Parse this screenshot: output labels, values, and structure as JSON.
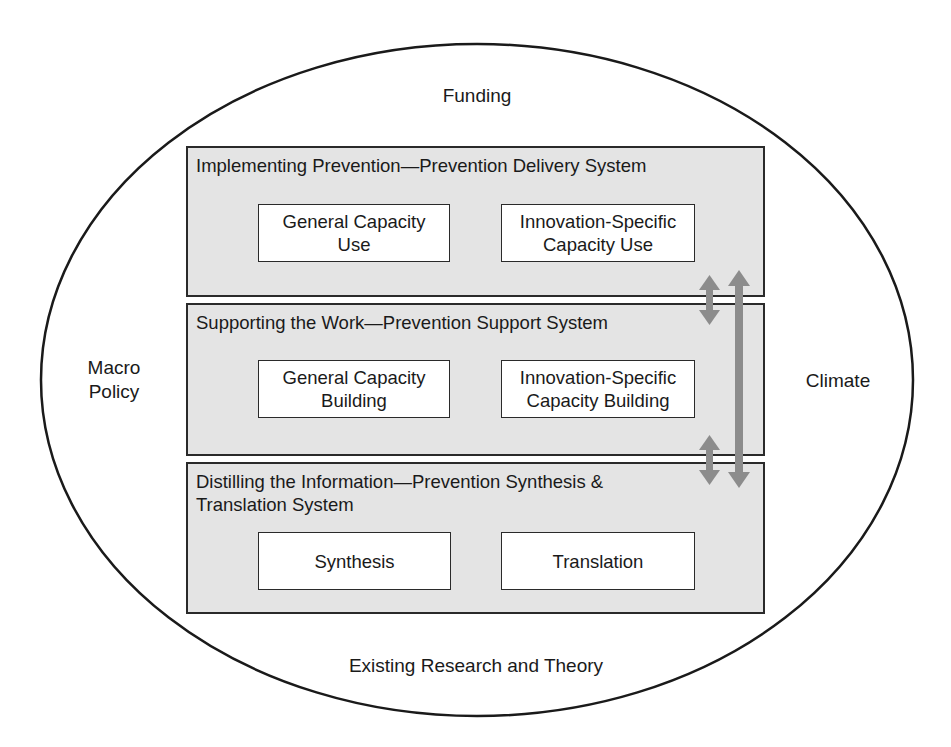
{
  "diagram": {
    "outer_labels": {
      "top": "Funding",
      "left_line1": "Macro",
      "left_line2": "Policy",
      "right": "Climate",
      "bottom": "Existing Research and Theory"
    },
    "systems": [
      {
        "title": "Implementing Prevention—Prevention Delivery System",
        "components": [
          {
            "line1": "General Capacity",
            "line2": "Use"
          },
          {
            "line1": "Innovation-Specific",
            "line2": "Capacity Use"
          }
        ]
      },
      {
        "title": "Supporting the Work—Prevention Support System",
        "components": [
          {
            "line1": "General Capacity",
            "line2": "Building"
          },
          {
            "line1": "Innovation-Specific",
            "line2": "Capacity Building"
          }
        ]
      },
      {
        "title_line1": "Distilling the Information—Prevention Synthesis &",
        "title_line2": "Translation System",
        "components": [
          {
            "line1": "Synthesis"
          },
          {
            "line1": "Translation"
          }
        ]
      }
    ],
    "arrows": [
      {
        "name": "delivery-support-arrow",
        "type": "bidirectional"
      },
      {
        "name": "support-synthesis-arrow",
        "type": "bidirectional"
      },
      {
        "name": "delivery-synthesis-arrow",
        "type": "bidirectional"
      }
    ],
    "colors": {
      "system_fill": "#e4e4e4",
      "arrow": "#8c8c8c",
      "stroke": "#2a2a2a"
    }
  }
}
